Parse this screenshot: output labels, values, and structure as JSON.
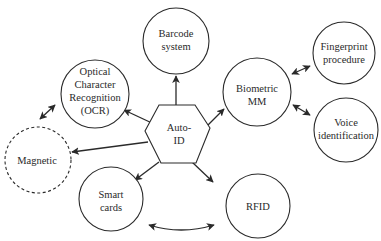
{
  "diagram": {
    "center": {
      "id": "auto-id",
      "shape": "hexagon",
      "lines": [
        "Auto-",
        "ID"
      ],
      "cx": 180,
      "cy": 148
    },
    "nodes": [
      {
        "id": "barcode",
        "lines": [
          "Barcode",
          "system"
        ],
        "cx": 176,
        "cy": 41,
        "r": 33,
        "dashed": false
      },
      {
        "id": "ocr",
        "lines": [
          "Optical",
          "Character",
          "Recognition",
          "(OCR)"
        ],
        "cx": 95,
        "cy": 94,
        "r": 34,
        "dashed": false
      },
      {
        "id": "biometric",
        "lines": [
          "Biometric",
          "MM"
        ],
        "cx": 257,
        "cy": 92,
        "r": 34,
        "dashed": false
      },
      {
        "id": "fingerprint",
        "lines": [
          "Fingerprint",
          "procedure"
        ],
        "cx": 344,
        "cy": 53,
        "r": 31,
        "dashed": false
      },
      {
        "id": "voice",
        "lines": [
          "Voice",
          "identification"
        ],
        "cx": 346,
        "cy": 130,
        "r": 32,
        "dashed": false
      },
      {
        "id": "magnetic",
        "lines": [
          "Magnetic"
        ],
        "cx": 38,
        "cy": 160,
        "r": 33,
        "dashed": true
      },
      {
        "id": "smart-cards",
        "lines": [
          "Smart",
          "cards"
        ],
        "cx": 111,
        "cy": 199,
        "r": 32,
        "dashed": false
      },
      {
        "id": "rfid",
        "lines": [
          "RFID"
        ],
        "cx": 258,
        "cy": 206,
        "r": 32,
        "dashed": false
      }
    ],
    "edges": [
      {
        "from": "auto-id",
        "to": "barcode",
        "type": "directed"
      },
      {
        "from": "auto-id",
        "to": "ocr",
        "type": "directed"
      },
      {
        "from": "auto-id",
        "to": "biometric",
        "type": "directed"
      },
      {
        "from": "auto-id",
        "to": "magnetic",
        "type": "directed"
      },
      {
        "from": "auto-id",
        "to": "smart-cards",
        "type": "directed"
      },
      {
        "from": "auto-id",
        "to": "rfid",
        "type": "directed"
      },
      {
        "from": "biometric",
        "to": "fingerprint",
        "type": "bidirectional"
      },
      {
        "from": "biometric",
        "to": "voice",
        "type": "bidirectional"
      },
      {
        "from": "ocr",
        "to": "magnetic",
        "type": "bidirectional"
      },
      {
        "from": "smart-cards",
        "to": "rfid",
        "type": "bidirectional-curved"
      }
    ],
    "colors": {
      "stroke": "#2a2a2a",
      "fill": "#ffffff",
      "text": "#2a2a2a"
    }
  }
}
